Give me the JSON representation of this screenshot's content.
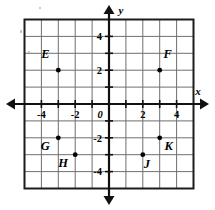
{
  "figure": {
    "type": "coordinate-plane",
    "axis_labels": {
      "x": "x",
      "y": "y"
    },
    "origin_label": "0",
    "x_tick_labels": [
      "-4",
      "-2",
      "2",
      "4"
    ],
    "y_tick_labels": [
      "4",
      "2",
      "-2",
      "-4"
    ],
    "grid": {
      "visible": true,
      "x_min": -5,
      "x_max": 5,
      "y_min": -5,
      "y_max": 5,
      "step": 1
    },
    "colors": {
      "grid_line": "#6f6f6f",
      "grid_border": "#1c1c1c",
      "axis": "#111111",
      "point": "#000000",
      "label": "#000000",
      "background": "#ffffff"
    }
  },
  "chart_data": {
    "type": "scatter",
    "title": "",
    "xlabel": "x",
    "ylabel": "y",
    "xlim": [
      -5,
      5
    ],
    "ylim": [
      -5,
      5
    ],
    "xticks": [
      -4,
      -2,
      2,
      4
    ],
    "yticks": [
      4,
      2,
      -2,
      -4
    ],
    "grid": true,
    "legend": "none",
    "points": [
      {
        "label": "E",
        "x": -3,
        "y": 2,
        "label_dx": -13,
        "label_dy": -12
      },
      {
        "label": "F",
        "x": 3,
        "y": 2,
        "label_dx": 8,
        "label_dy": -12
      },
      {
        "label": "G",
        "x": -3,
        "y": -2,
        "label_dx": -13,
        "label_dy": 12
      },
      {
        "label": "H",
        "x": -2,
        "y": -3,
        "label_dx": -12,
        "label_dy": 12
      },
      {
        "label": "J",
        "x": 2,
        "y": -3,
        "label_dx": 4,
        "label_dy": 13
      },
      {
        "label": "K",
        "x": 3,
        "y": -2,
        "label_dx": 9,
        "label_dy": 12
      }
    ]
  },
  "geometry": {
    "origin_x": 109,
    "origin_y": 104,
    "cell": 16.9,
    "grid_left": 24.5,
    "grid_right": 193.5,
    "grid_top": 19.5,
    "grid_bottom": 188.5,
    "axis_x_start": 6,
    "axis_x_end": 209,
    "axis_y_start": 5,
    "axis_y_end": 205
  }
}
